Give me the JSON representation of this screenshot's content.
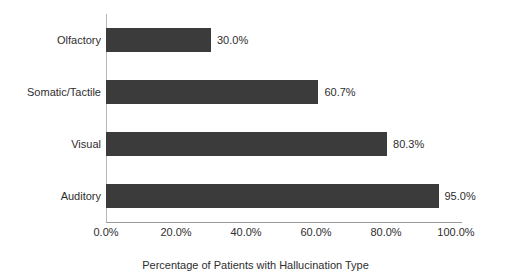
{
  "chart_data": {
    "type": "bar",
    "orientation": "horizontal",
    "title": "",
    "subtitle": "",
    "xlabel": "Percentage of Patients with Hallucination Type",
    "ylabel": "",
    "categories": [
      "Olfactory",
      "Somatic/Tactile",
      "Visual",
      "Auditory"
    ],
    "values": [
      30.0,
      60.7,
      80.3,
      95.0
    ],
    "value_labels": [
      "30.0%",
      "60.7%",
      "80.3%",
      "95.0%"
    ],
    "xlim": [
      0,
      100
    ],
    "xticks": [
      0,
      20,
      40,
      60,
      80,
      100
    ],
    "xtick_labels": [
      "0.0%",
      "20.0%",
      "40.0%",
      "60.0%",
      "80.0%",
      "100.0%"
    ],
    "grid": false,
    "legend": null,
    "bar_color": "#3b3b3b",
    "axis_color": "#9a9a9a",
    "text_color": "#2e2e2e",
    "background": "#ffffff"
  }
}
